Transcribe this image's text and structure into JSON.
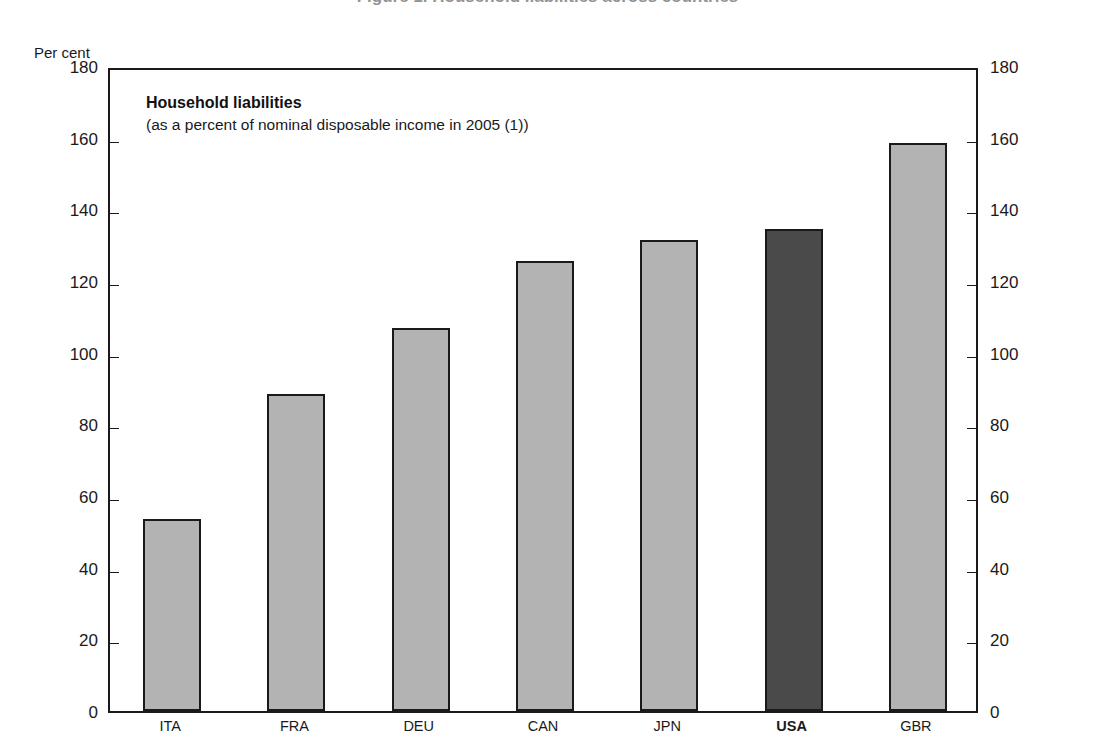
{
  "page": {
    "clipped_top_title": "Figure 1. Household liabilities across countries"
  },
  "axis": {
    "unit_label": "Per cent"
  },
  "caption": {
    "title": "Household liabilities",
    "subtitle": "(as a percent of nominal disposable income in 2005 (1))"
  },
  "chart_data": {
    "type": "bar",
    "title": "Household liabilities",
    "subtitle": "(as a percent of nominal disposable income in 2005 (1))",
    "xlabel": "",
    "ylabel": "Per cent",
    "ylim": [
      0,
      180
    ],
    "yticks": [
      0,
      20,
      40,
      60,
      80,
      100,
      120,
      140,
      160,
      180
    ],
    "ytick_labels": [
      "0",
      "20",
      "40",
      "60",
      "80",
      "100",
      "120",
      "140",
      "160",
      "180"
    ],
    "grid": false,
    "legend": "none",
    "dual_axis": true,
    "categories": [
      "ITA",
      "FRA",
      "DEU",
      "CAN",
      "JPN",
      "USA",
      "GBR"
    ],
    "values": [
      53.5,
      88.5,
      107.0,
      125.5,
      131.5,
      134.5,
      158.5
    ],
    "highlight_category": "USA",
    "colors": {
      "bar_fill": "#b3b3b3",
      "bar_highlight_fill": "#4a4a4a",
      "bar_border": "#1a1a1a",
      "axis": "#1a1a1a",
      "text": "#1a1a1a",
      "background": "#ffffff"
    }
  }
}
